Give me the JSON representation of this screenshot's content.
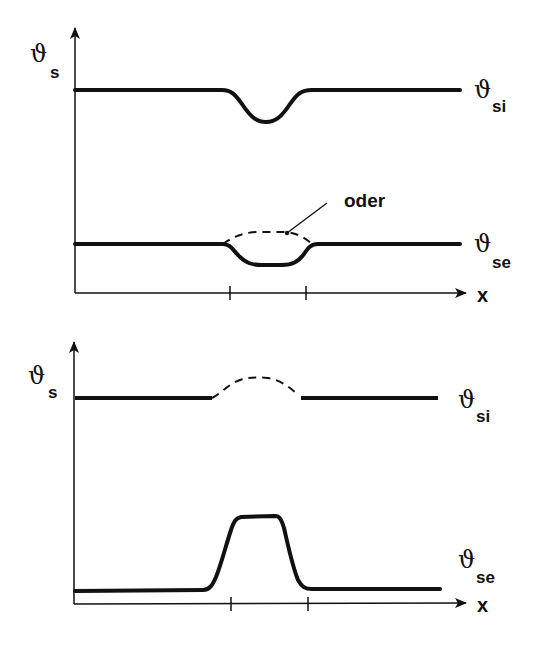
{
  "diagrams": [
    {
      "id": "top",
      "y_axis_label": {
        "symbol": "ϑ",
        "subscript": "s"
      },
      "x_axis_label": "x",
      "curves": [
        {
          "name": "inner-surface-temperature",
          "label_symbol": "ϑ",
          "label_subscript": "si",
          "style": "solid",
          "shape": "dip"
        },
        {
          "name": "outer-surface-temperature",
          "label_symbol": "ϑ",
          "label_subscript": "se",
          "style": "solid",
          "shape": "dip",
          "alternative": {
            "style": "dashed",
            "shape": "bump"
          }
        }
      ],
      "annotation": "oder",
      "ticks": 2
    },
    {
      "id": "bottom",
      "y_axis_label": {
        "symbol": "ϑ",
        "subscript": "s"
      },
      "x_axis_label": "x",
      "curves": [
        {
          "name": "inner-surface-temperature",
          "label_symbol": "ϑ",
          "label_subscript": "si",
          "style": "solid",
          "shape": "flat-with-dashed-bump"
        },
        {
          "name": "outer-surface-temperature",
          "label_symbol": "ϑ",
          "label_subscript": "se",
          "style": "solid",
          "shape": "plateau-peak"
        }
      ],
      "ticks": 2
    }
  ],
  "colors": {
    "line": "#111111",
    "background": "#ffffff"
  }
}
